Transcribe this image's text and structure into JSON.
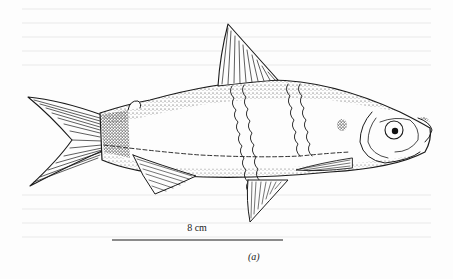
{
  "figure": {
    "scale_bar": {
      "label": "8 cm"
    },
    "panel_label": "(a)"
  },
  "colors": {
    "ink": "#1a1a1a",
    "paper": "#fdfdfd"
  }
}
